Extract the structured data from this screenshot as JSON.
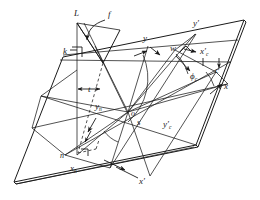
{
  "figure": {
    "type": "geometric-vector-diagram",
    "background_color": "#ffffff",
    "line_color": "#1a1a1a",
    "labels": {
      "L": "L",
      "f": "f",
      "k": "k",
      "t": "t",
      "y": "y",
      "y_prime": "y′",
      "w": "w",
      "x_prime_c": "x′",
      "x_prime_c_sub": "c",
      "c": "c",
      "phi_c": "ϕ",
      "phi_c_sub": "c",
      "x": "x",
      "o": "o",
      "s": "s",
      "y_n": "y",
      "y_n_sub": "n",
      "n": "n",
      "x_n": "x",
      "x_n_sub": "n",
      "x_prime": "x′",
      "y_prime_c": "y′",
      "y_prime_c_sub": "c"
    },
    "label_positions": {
      "L": {
        "x": 76,
        "y": 14
      },
      "f": {
        "x": 110,
        "y": 15
      },
      "k": {
        "x": 66,
        "y": 53
      },
      "t": {
        "x": 91,
        "y": 90
      },
      "y": {
        "x": 146,
        "y": 39
      },
      "y_prime": {
        "x": 197,
        "y": 25
      },
      "w": {
        "x": 174,
        "y": 49
      },
      "x_prime_c": {
        "x": 203,
        "y": 52
      },
      "c": {
        "x": 217,
        "y": 70
      },
      "phi_c": {
        "x": 194,
        "y": 76
      },
      "x": {
        "x": 226,
        "y": 86
      },
      "o": {
        "x": 125,
        "y": 112
      },
      "s": {
        "x": 139,
        "y": 121
      },
      "y_n": {
        "x": 99,
        "y": 106
      },
      "n": {
        "x": 65,
        "y": 155
      },
      "x_n": {
        "x": 74,
        "y": 168
      },
      "x_prime": {
        "x": 141,
        "y": 181
      },
      "y_prime_c": {
        "x": 166,
        "y": 124
      }
    }
  }
}
